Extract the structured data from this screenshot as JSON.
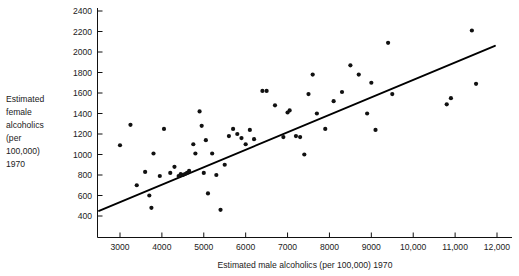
{
  "chart_data": {
    "type": "scatter",
    "title": "",
    "xlabel": "Estimated male alcoholics (per 100,000) 1970",
    "ylabel": "Estimated female alcoholics (per 100,000) 1970",
    "ylabel_lines": [
      "Estimated",
      "female",
      "alcoholics",
      "(per",
      "100,000)",
      "1970"
    ],
    "xlim": [
      2500,
      12150
    ],
    "ylim": [
      290,
      2480
    ],
    "xticks": [
      3000,
      4000,
      5000,
      6000,
      7000,
      8000,
      9000,
      10000,
      11000,
      12000
    ],
    "xticklabels": [
      "3000",
      "4000",
      "5000",
      "6000",
      "7000",
      "8000",
      "9000",
      "10,000",
      "11,000",
      "12,000"
    ],
    "yticks": [
      400,
      600,
      800,
      1000,
      1200,
      1400,
      1600,
      1800,
      2000,
      2200,
      2400
    ],
    "yticklabels": [
      "400",
      "600",
      "800",
      "1000",
      "1200",
      "1400",
      "1600",
      "1800",
      "2000",
      "2200",
      "2400"
    ],
    "grid": false,
    "legend": null,
    "marker": "filled-circle",
    "marker_color": "#111111",
    "line_color": "#000000",
    "x": [
      3000,
      3250,
      3400,
      3600,
      3700,
      3750,
      3800,
      3950,
      4050,
      4200,
      4300,
      4400,
      4450,
      4500,
      4550,
      4600,
      4650,
      4750,
      4800,
      4900,
      4950,
      5000,
      5050,
      5100,
      5200,
      5300,
      5400,
      5500,
      5600,
      5700,
      5800,
      5900,
      6000,
      6100,
      6200,
      6400,
      6500,
      6700,
      6900,
      7000,
      7050,
      7200,
      7300,
      7400,
      7500,
      7600,
      7700,
      7900,
      8100,
      8300,
      8500,
      8700,
      8900,
      9000,
      9100,
      9400,
      9500,
      10800,
      10900,
      11400,
      11500
    ],
    "y": [
      1090,
      1290,
      700,
      830,
      600,
      480,
      1010,
      790,
      1250,
      820,
      880,
      790,
      810,
      800,
      810,
      820,
      840,
      1100,
      1010,
      1420,
      1280,
      820,
      1140,
      620,
      1010,
      800,
      460,
      900,
      1180,
      1250,
      1200,
      1160,
      1100,
      1240,
      1150,
      1620,
      1620,
      1480,
      1170,
      1410,
      1430,
      1180,
      1170,
      1000,
      1590,
      1780,
      1400,
      1250,
      1520,
      1610,
      1870,
      1780,
      1400,
      1700,
      1240,
      2090,
      1590,
      1490,
      1550,
      2210,
      1690
    ],
    "fit_line": {
      "x0": 2500,
      "y0": 450,
      "x1": 11950,
      "y1": 2060
    }
  }
}
